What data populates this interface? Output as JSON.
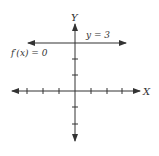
{
  "diagram": {
    "title": "",
    "axes": {
      "x_label": "X",
      "y_label": "Y",
      "x_ticks": [
        -4,
        -3,
        -2,
        -1,
        1,
        2,
        3,
        4
      ],
      "y_ticks": [
        -3,
        -2,
        -1,
        1,
        2,
        3
      ],
      "color": "#333333"
    },
    "line": {
      "equation_label": "y = 3",
      "derivative_label": "f′(x) = 0",
      "y_value": 3,
      "color": "#333333"
    }
  }
}
